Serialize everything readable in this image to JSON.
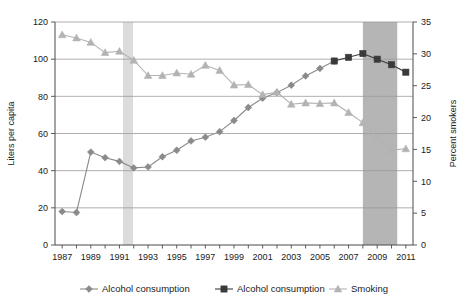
{
  "chart_data": {
    "type": "line",
    "title": "",
    "xlabel": "",
    "ylabel": "Liters per capita",
    "y2label": "Percent smokers",
    "xlim": [
      1986.5,
      2011.5
    ],
    "ylim": [
      0,
      120
    ],
    "y2lim": [
      0,
      35
    ],
    "grid": true,
    "legend_position": "bottom",
    "x": [
      1987,
      1988,
      1989,
      1990,
      1991,
      1992,
      1993,
      1994,
      1995,
      1996,
      1997,
      1998,
      1999,
      2000,
      2001,
      2002,
      2003,
      2004,
      2005,
      2006,
      2007,
      2008,
      2009,
      2010,
      2011
    ],
    "x_tick_labels": [
      "1987",
      "1989",
      "1991",
      "1993",
      "1995",
      "1997",
      "1999",
      "2001",
      "2003",
      "2005",
      "2007",
      "2009",
      "2011"
    ],
    "x_ticks": [
      1987,
      1989,
      1991,
      1993,
      1995,
      1997,
      1999,
      2001,
      2003,
      2005,
      2007,
      2009,
      2011
    ],
    "y_ticks": [
      0,
      20,
      40,
      60,
      80,
      100,
      120
    ],
    "y_tick_labels": [
      "0",
      "20",
      "40",
      "60",
      "80",
      "100",
      "120"
    ],
    "y2_ticks": [
      0,
      5,
      10,
      15,
      20,
      25,
      30,
      35
    ],
    "y2_tick_labels": [
      "0",
      "5",
      "10",
      "15",
      "20",
      "25",
      "30",
      "35"
    ],
    "series": [
      {
        "name": "Alcohol consumption",
        "key": "alcohol-diamond",
        "marker": "diamond",
        "axis": "left",
        "color": "#8a8a8a",
        "x": [
          1987,
          1988,
          1989,
          1990,
          1991,
          1992,
          1993,
          1994,
          1995,
          1996,
          1997,
          1998,
          1999,
          2000,
          2001,
          2002,
          2003,
          2004,
          2005,
          2006
        ],
        "values": [
          18,
          17.5,
          50,
          47,
          45,
          41.5,
          42,
          47.5,
          51,
          56,
          58,
          61,
          67,
          74,
          79,
          82,
          86,
          91,
          95,
          99
        ]
      },
      {
        "name": "Alcohol consumption",
        "key": "alcohol-square",
        "marker": "square",
        "axis": "left",
        "color": "#3a3a3a",
        "x": [
          2006,
          2007,
          2008,
          2009,
          2010,
          2011
        ],
        "values": [
          99,
          101,
          103,
          100,
          97,
          93
        ]
      },
      {
        "name": "Smoking",
        "key": "smoking",
        "marker": "triangle",
        "axis": "right",
        "color": "#b3b3b3",
        "x": [
          1987,
          1988,
          1989,
          1990,
          1991,
          1992,
          1993,
          1994,
          1995,
          1996,
          1997,
          1998,
          1999,
          2000,
          2001,
          2002,
          2003,
          2004,
          2005,
          2006,
          2007,
          2008,
          2009,
          2010,
          2011
        ],
        "values": [
          33.0,
          32.5,
          31.8,
          30.2,
          30.4,
          29.0,
          26.6,
          26.6,
          27.0,
          26.8,
          28.2,
          27.4,
          25.1,
          25.2,
          23.6,
          24.0,
          22.1,
          22.3,
          22.2,
          22.3,
          20.8,
          19.2,
          16.9,
          14.9,
          15.1
        ]
      }
    ],
    "shaded_bands": [
      {
        "name": "band-1991",
        "from": 1991.25,
        "to": 1991.95,
        "color": "#dcdcdc"
      },
      {
        "name": "band-2008",
        "from": 2008.0,
        "to": 2010.4,
        "color": "#b5b5b5"
      }
    ]
  },
  "legend": {
    "items": [
      {
        "label": "Alcohol consumption",
        "marker": "diamond",
        "color": "#8a8a8a"
      },
      {
        "label": "Alcohol consumption",
        "marker": "square",
        "color": "#3a3a3a"
      },
      {
        "label": "Smoking",
        "marker": "triangle",
        "color": "#b3b3b3"
      }
    ]
  },
  "axes": {
    "left_title": "Liters per capita",
    "right_title": "Percent smokers"
  }
}
